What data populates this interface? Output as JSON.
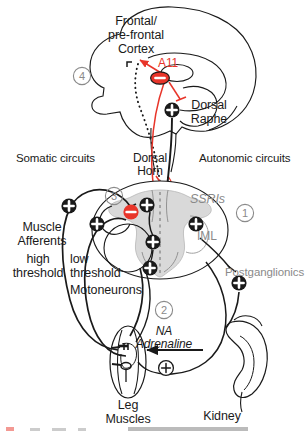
{
  "figure": {
    "type": "neuroanatomical-circuit-diagram",
    "width": 307,
    "height": 431,
    "background": "#ffffff"
  },
  "colors": {
    "ink": "#1a1a1a",
    "grey_text": "#8a8a8a",
    "inhibitory_red": "#e8352a",
    "grey_matter_fill": "#d9d9d9",
    "white": "#ffffff"
  },
  "labels": {
    "cortex": "Frontal/\npre-frontal\nCortex",
    "a11": "A11",
    "dorsal_raphe": "Dorsal\nRaphe",
    "somatic_circuits": "Somatic circuits",
    "autonomic_circuits": "Autonomic circuits",
    "dorsal_horn": "Dorsal\nHorn",
    "ssris": "SSRIs",
    "iml": "IML",
    "muscle_afferents": "Muscle\nAfferents",
    "high_threshold": "high\nthreshold",
    "low_threshold": "low\nthreshold",
    "motoneurons": "Motoneurons",
    "postganglionics": "Postganglionics",
    "na_adrenaline": "NA\nAdrenaline",
    "leg_muscles": "Leg\nMuscles",
    "kidney": "Kidney"
  },
  "callouts": [
    {
      "id": "1",
      "label": "1",
      "region": "autonomic-IML"
    },
    {
      "id": "2",
      "label": "2",
      "region": "periphery-adrenaline"
    },
    {
      "id": "3",
      "label": "3",
      "region": "dorsal-horn-somatic"
    },
    {
      "id": "4",
      "label": "4",
      "region": "brain-cortex"
    }
  ],
  "nodes": [
    {
      "name": "raphe-excitatory",
      "sign": "+",
      "style": "filled-black"
    },
    {
      "name": "a11-inhibitory",
      "sign": "−",
      "style": "filled-red-oval"
    },
    {
      "name": "dorsal-horn-inhibitory",
      "sign": "−",
      "style": "filled-red"
    },
    {
      "name": "dorsal-horn-excitatory",
      "sign": "+",
      "style": "filled-black"
    },
    {
      "name": "interneuron-excitatory",
      "sign": "+",
      "style": "filled-black"
    },
    {
      "name": "motoneuron-excitatory",
      "sign": "+",
      "style": "filled-black"
    },
    {
      "name": "iml-excitatory",
      "sign": "+",
      "style": "filled-black"
    },
    {
      "name": "muscle-afferent-high-excitatory",
      "sign": "+",
      "style": "filled-black"
    },
    {
      "name": "muscle-afferent-low-excitatory",
      "sign": "+",
      "style": "filled-black"
    },
    {
      "name": "postganglionic-excitatory",
      "sign": "+",
      "style": "filled-black"
    },
    {
      "name": "adrenaline-excitatory",
      "sign": "+",
      "style": "outline-black"
    }
  ],
  "caption_fragment": {
    "visible": true,
    "note": "clipped text row at bottom edge"
  }
}
